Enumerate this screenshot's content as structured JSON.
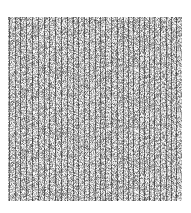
{
  "image": {
    "description": "Grayscale noise texture with dense vertical stripe pattern",
    "colors": {
      "background": "#ffffff",
      "stripe_dark": "#4a4a4a",
      "noise_mid": "#9a9a9a",
      "noise_light": "#d8d8d8"
    }
  }
}
